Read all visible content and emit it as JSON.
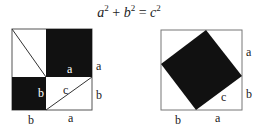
{
  "formula": {
    "text": "a² + b² = c²",
    "a": "a",
    "b": "b",
    "c": "c",
    "exp": "2",
    "plus": "+",
    "eq": "="
  },
  "left_diagram": {
    "labels": {
      "top_right_side": "a",
      "black_square_a": "a",
      "black_square_b": "b",
      "hypotenuse": "c",
      "bottom_right_side": "b",
      "bottom_left": "b",
      "bottom_right": "a"
    }
  },
  "right_diagram": {
    "labels": {
      "right_top": "a",
      "right_bottom": "b",
      "hypotenuse": "c",
      "bottom_left": "b",
      "bottom_right": "a"
    }
  },
  "colors": {
    "fill": "#111111",
    "stroke": "#555555",
    "background": "#ffffff"
  }
}
